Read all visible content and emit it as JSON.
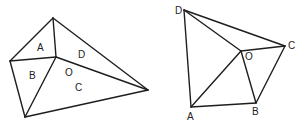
{
  "figures": [
    {
      "name": "left-quadrilateral",
      "vertices": {
        "top": [
          53,
          18
        ],
        "left": [
          10,
          61
        ],
        "inner": [
          56,
          57
        ],
        "right": [
          148,
          90
        ],
        "bottom": [
          25,
          117
        ]
      },
      "edges": [
        [
          "top",
          "left"
        ],
        [
          "top",
          "right"
        ],
        [
          "left",
          "bottom"
        ],
        [
          "bottom",
          "right"
        ],
        [
          "left",
          "inner"
        ],
        [
          "top",
          "inner"
        ],
        [
          "inner",
          "right"
        ],
        [
          "inner",
          "bottom"
        ]
      ],
      "labels": [
        {
          "text": "A",
          "x": 37,
          "y": 51
        },
        {
          "text": "B",
          "x": 29,
          "y": 79
        },
        {
          "text": "D",
          "x": 78,
          "y": 58
        },
        {
          "text": "O",
          "x": 65,
          "y": 76
        },
        {
          "text": "C",
          "x": 75,
          "y": 91
        }
      ]
    },
    {
      "name": "right-quadrilateral",
      "vertices": {
        "D": [
          184,
          10
        ],
        "C": [
          285,
          46
        ],
        "O": [
          241,
          51
        ],
        "A": [
          191,
          107
        ],
        "B": [
          256,
          103
        ]
      },
      "edges": [
        [
          "D",
          "C"
        ],
        [
          "D",
          "A"
        ],
        [
          "A",
          "B"
        ],
        [
          "B",
          "C"
        ],
        [
          "D",
          "O"
        ],
        [
          "O",
          "C"
        ],
        [
          "O",
          "A"
        ],
        [
          "O",
          "B"
        ]
      ],
      "labels": [
        {
          "text": "D",
          "x": 175,
          "y": 14
        },
        {
          "text": "C",
          "x": 288,
          "y": 49
        },
        {
          "text": "O",
          "x": 245,
          "y": 60
        },
        {
          "text": "A",
          "x": 187,
          "y": 120
        },
        {
          "text": "B",
          "x": 252,
          "y": 115
        }
      ]
    }
  ]
}
